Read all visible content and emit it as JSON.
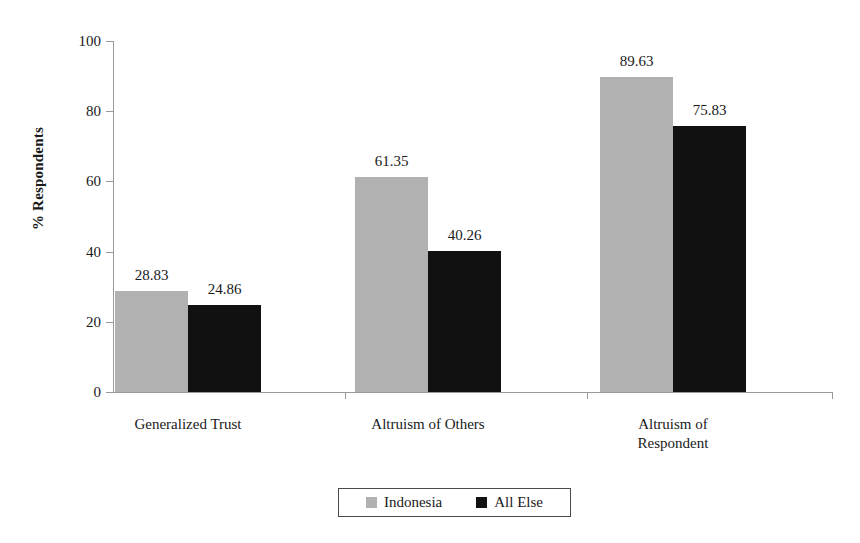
{
  "chart_data": {
    "type": "bar",
    "title": "",
    "xlabel": "",
    "ylabel": "% Respondents",
    "ylim": [
      0,
      100
    ],
    "yticks": [
      0,
      20,
      40,
      60,
      80,
      100
    ],
    "ytick_labels": [
      "0",
      "20",
      "40",
      "60",
      "80",
      "100"
    ],
    "grid": false,
    "legend_position": "bottom-center",
    "categories": [
      "Generalized Trust",
      "Altruism of Others",
      "Altruism of Respondent"
    ],
    "series": [
      {
        "name": "Indonesia",
        "color": "#b1b1b1",
        "values": [
          28.83,
          61.35,
          89.63
        ],
        "value_labels": [
          "28.83",
          "61.35",
          "89.63"
        ]
      },
      {
        "name": "All Else",
        "color": "#111111",
        "values": [
          24.86,
          40.26,
          75.83
        ],
        "value_labels": [
          "24.86",
          "40.26",
          "75.83"
        ]
      }
    ]
  },
  "axes": {
    "y_title": "% Respondents"
  },
  "legend": {
    "entries": [
      {
        "label": "Indonesia",
        "swatch": "light-gray-swatch-icon"
      },
      {
        "label": "All Else",
        "swatch": "black-swatch-icon"
      }
    ]
  },
  "category_labels": [
    "Generalized Trust",
    "Altruism of Others",
    "Altruism of\nRespondent"
  ]
}
